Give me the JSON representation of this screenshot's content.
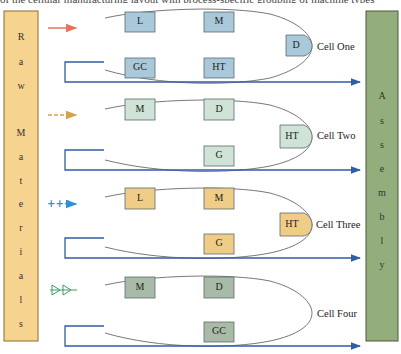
{
  "caption_fragment": "of the cellular manufacturing layout with process-specific grouping of machine types",
  "colors": {
    "raw_materials_fill": "#f6d48f",
    "raw_materials_border": "#8a6a2e",
    "assembly_fill": "#93ad7c",
    "assembly_border": "#4a5a3a",
    "flow_line": "#2f5ea6",
    "ellipse_stroke": "#555555",
    "cell_one_box": "#a9c9da",
    "cell_two_box": "#cfe3d6",
    "cell_three_box": "#f0cd86",
    "cell_four_box": "#a9bba6",
    "box_border": "#5a6a72",
    "arrow_one": "#e8735a",
    "arrow_two": "#d4a24a",
    "arrow_three": "#2e8fd6",
    "arrow_four": "#3f9a6a"
  },
  "raw_materials": {
    "letters": [
      "R",
      "a",
      "w",
      "M",
      "a",
      "t",
      "e",
      "r",
      "i",
      "a",
      "l",
      "s"
    ]
  },
  "assembly": {
    "letters": [
      "A",
      "s",
      "s",
      "e",
      "m",
      "b",
      "l",
      "y"
    ]
  },
  "cells": [
    {
      "label": "Cell One",
      "input_arrow": "solid-arrow-icon",
      "machines": [
        "L",
        "M",
        "D",
        "GC",
        "HT"
      ]
    },
    {
      "label": "Cell Two",
      "input_arrow": "dashed-arrow-icon",
      "machines": [
        "M",
        "D",
        "HT",
        "G"
      ]
    },
    {
      "label": "Cell Three",
      "input_arrow": "plus-arrow-icon",
      "machines": [
        "L",
        "M",
        "HT",
        "G"
      ]
    },
    {
      "label": "Cell Four",
      "input_arrow": "double-triangle-arrow-icon",
      "machines": [
        "M",
        "D",
        "GC"
      ]
    }
  ]
}
